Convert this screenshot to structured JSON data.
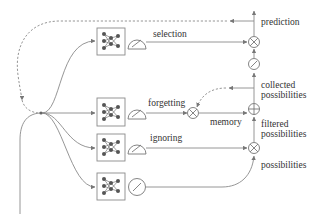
{
  "diagram": {
    "type": "LSTM-style gated cell diagram",
    "labels": {
      "selection": "selection",
      "forgetting": "forgetting",
      "ignoring": "ignoring",
      "memory": "memory",
      "prediction": "prediction",
      "collected_1": "collected",
      "collected_2": "possibilities",
      "filtered_1": "filtered",
      "filtered_2": "possibilities",
      "possibilities": "possibilities"
    },
    "gates": [
      {
        "name": "selection",
        "activation": "squash-gauge"
      },
      {
        "name": "forgetting",
        "activation": "squash-gauge"
      },
      {
        "name": "ignoring",
        "activation": "squash-gauge"
      },
      {
        "name": "possibilities",
        "activation": "squash-gauge"
      }
    ],
    "operators": [
      {
        "name": "selection-multiply",
        "symbol": "×"
      },
      {
        "name": "forgetting-multiply",
        "symbol": "×"
      },
      {
        "name": "memory-add",
        "symbol": "+"
      },
      {
        "name": "ignoring-multiply",
        "symbol": "×"
      }
    ],
    "colors": {
      "line": "#8a8a8a",
      "node": "#555555",
      "text": "#333333"
    }
  }
}
